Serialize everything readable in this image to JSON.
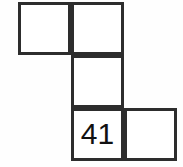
{
  "figure": {
    "shape_name": "s-tetromino-net",
    "background_color": "#fefefe",
    "cell_fill_color": "#ffffff",
    "line_color": "#2d2d2d",
    "line_width_px": 3,
    "text_color": "#111111",
    "cell_size_px": 53,
    "grid_columns": 3,
    "grid_rows": 3,
    "cells": [
      {
        "id": "cell-r0-c0",
        "row": 0,
        "col": 0,
        "label": "",
        "x": 18,
        "y": 2,
        "width": 53,
        "height": 53
      },
      {
        "id": "cell-r0-c1",
        "row": 0,
        "col": 1,
        "label": "",
        "x": 71,
        "y": 2,
        "width": 53,
        "height": 53
      },
      {
        "id": "cell-r1-c1",
        "row": 1,
        "col": 1,
        "label": "",
        "x": 71,
        "y": 55,
        "width": 53,
        "height": 53
      },
      {
        "id": "cell-r2-c1",
        "row": 2,
        "col": 1,
        "label": "41",
        "x": 71,
        "y": 108,
        "width": 53,
        "height": 53
      },
      {
        "id": "cell-r2-c2",
        "row": 2,
        "col": 2,
        "label": "",
        "x": 124,
        "y": 108,
        "width": 53,
        "height": 53
      }
    ]
  }
}
